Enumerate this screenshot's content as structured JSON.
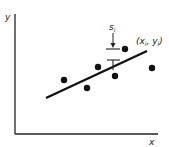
{
  "diagram": {
    "axis_labels": {
      "y": "y",
      "x": "x"
    },
    "point_label": "(xᵢ, yᵢ)",
    "point_label_parts": {
      "open": "(",
      "x": "x",
      "xsub": "i",
      "comma": ", ",
      "y": "y",
      "ysub": "i",
      "close": ")"
    },
    "error_label": {
      "base": "s",
      "sub": "i"
    },
    "points": [
      {
        "x": 64,
        "y": 80
      },
      {
        "x": 87,
        "y": 88
      },
      {
        "x": 98,
        "y": 67
      },
      {
        "x": 115,
        "y": 76
      },
      {
        "x": 125,
        "y": 49
      },
      {
        "x": 152,
        "y": 68
      }
    ],
    "fit_line": {
      "x1": 46,
      "y1": 98,
      "x2": 147,
      "y2": 51
    },
    "colors": {
      "ink": "#111111",
      "background": "#ffffff"
    }
  }
}
